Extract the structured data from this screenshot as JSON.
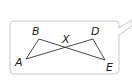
{
  "diagram": {
    "type": "geometry-figure",
    "labels": {
      "A": "A",
      "B": "B",
      "X": "X",
      "D": "D",
      "E": "E"
    },
    "points": {
      "A": [
        26,
        59
      ],
      "B": [
        39,
        39
      ],
      "X": [
        66,
        47
      ],
      "D": [
        93,
        39
      ],
      "E": [
        105,
        60
      ]
    },
    "segments": [
      [
        "A",
        "B"
      ],
      [
        "B",
        "E"
      ],
      [
        "A",
        "D"
      ],
      [
        "D",
        "E"
      ]
    ],
    "colors": {
      "box_border": "#c8c8c8",
      "line": "#333333",
      "text": "#222222",
      "background": "#ffffff"
    }
  }
}
